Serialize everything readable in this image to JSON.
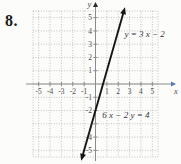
{
  "problem": {
    "number": "8."
  },
  "colors": {
    "background": "#fcfcfa",
    "grid": "#b4b4b4",
    "axis": "#8b8b8b",
    "x_axis_arrow": "#5377c0",
    "y_axis_arrow": "#2f2f2f",
    "line": "#161616",
    "equation_text": "#35353b",
    "tick_text": "#4c4c4c"
  },
  "chart_data": {
    "type": "line",
    "title": "",
    "xlabel": "x",
    "ylabel": "y",
    "x_range": [
      -5.5,
      5.5
    ],
    "y_range": [
      -5.5,
      5.5
    ],
    "grid": true,
    "x_ticks": [
      -5,
      -4,
      -3,
      -2,
      -1,
      1,
      2,
      3,
      4,
      5
    ],
    "y_ticks": [
      5,
      4,
      3,
      2,
      1,
      -1,
      -2,
      -4,
      -5
    ],
    "series": [
      {
        "name": "y = 3x - 2",
        "slope": 3,
        "intercept": -2,
        "endpoints": [
          [
            -1.12,
            -5.35
          ],
          [
            2.45,
            5.35
          ]
        ],
        "arrows": "both"
      }
    ],
    "annotations": [
      {
        "text": "y = 3 x − 2",
        "x": 2.55,
        "y": 3.8,
        "anchor": "start"
      },
      {
        "text": "6 x − 2 y = 4",
        "x": 0.6,
        "y": -2.35,
        "anchor": "start"
      }
    ]
  }
}
